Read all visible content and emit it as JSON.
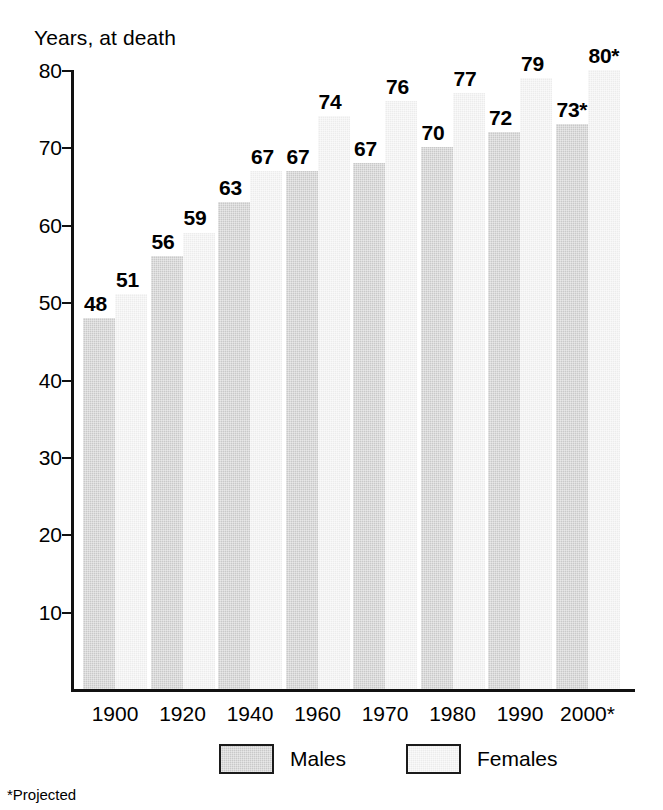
{
  "chart_data": {
    "type": "bar",
    "title": "Years, at death",
    "xlabel": "",
    "ylabel": "Years, at death",
    "ylim": [
      0,
      80
    ],
    "ytick_values": [
      10,
      20,
      30,
      40,
      50,
      60,
      70,
      80
    ],
    "ytick_labels": [
      "10",
      "20",
      "30",
      "40",
      "50",
      "60",
      "70",
      "80"
    ],
    "grid": false,
    "legend_position": "bottom-center",
    "categories": [
      "1900",
      "1920",
      "1940",
      "1960",
      "1970",
      "1980",
      "1990",
      "2000*"
    ],
    "series": [
      {
        "name": "Males",
        "color": "#c9c9c9",
        "values": [
          48,
          56,
          63,
          67,
          68,
          70,
          72,
          73
        ],
        "labels": [
          "48",
          "56",
          "63",
          "67",
          "67",
          "70",
          "72",
          "73*"
        ]
      },
      {
        "name": "Females",
        "color": "#ececec",
        "values": [
          51,
          59,
          67,
          74,
          76,
          77,
          79,
          80
        ],
        "labels": [
          "51",
          "59",
          "67",
          "74",
          "76",
          "77",
          "79",
          "80*"
        ]
      }
    ],
    "annotations": [
      "*Projected"
    ]
  },
  "legend": {
    "males_label": "Males",
    "females_label": "Females"
  },
  "footnote": {
    "text": "*Projected"
  }
}
